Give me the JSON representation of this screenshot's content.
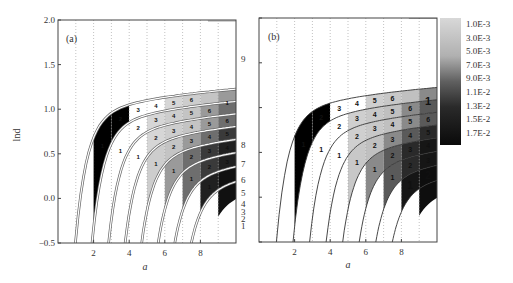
{
  "chart_data": [
    {
      "type": "heatmap",
      "panel": "(a)",
      "xlabel": "a",
      "ylabel": "lnd",
      "xlim": [
        0,
        10
      ],
      "ylim": [
        -0.5,
        2.0
      ],
      "xticks": [
        2,
        4,
        6,
        8
      ],
      "yticks": [
        -0.5,
        0.0,
        0.5,
        1.0,
        1.5,
        2.0
      ],
      "ytick_labels": [
        "−0.5",
        "0.0",
        "0.5",
        "1.0",
        "1.5",
        "2.0"
      ],
      "grid": "dotted vertical at integer a",
      "boundary_curve_labels": [
        "1",
        "2",
        "3",
        "4",
        "5",
        "6",
        "7",
        "8",
        "9"
      ],
      "region_numbers": "regions numbered 1..6 along each band between successive curves"
    },
    {
      "type": "heatmap",
      "panel": "(b)",
      "xlabel": "a",
      "xlim": [
        0,
        10
      ],
      "ylim": [
        -0.5,
        2.0
      ],
      "xticks": [
        2,
        4,
        6,
        8
      ],
      "colorbar": {
        "labels": [
          "1.0E-3",
          "3.0E-3",
          "5.0E-3",
          "7.0E-3",
          "9.0E-3",
          "1.1E-2",
          "1.3E-2",
          "1.5E-2",
          "1.7E-2"
        ],
        "range": [
          0.001,
          0.017
        ],
        "colormap": "gray (light to dark)"
      }
    }
  ],
  "figure": {
    "panel_a_label": "(a)",
    "panel_b_label": "(b)",
    "x_axis_label": "a",
    "y_axis_label": "lnd",
    "x_tick_labels": [
      "2",
      "4",
      "6",
      "8"
    ],
    "y_tick_labels": [
      "−0.5",
      "0.0",
      "0.5",
      "1.0",
      "1.5",
      "2.0"
    ],
    "right_curve_labels": [
      "9",
      "8",
      "7",
      "6",
      "5",
      "4",
      "3",
      "2",
      "1"
    ],
    "colorbar_labels": [
      "1.0E-3",
      "3.0E-3",
      "5.0E-3",
      "7.0E-3",
      "9.0E-3",
      "1.1E-2",
      "1.3E-2",
      "1.5E-2",
      "1.7E-2"
    ]
  }
}
